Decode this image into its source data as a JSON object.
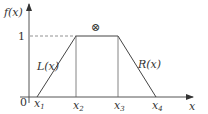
{
  "figure": {
    "type": "trapezoidal membership function",
    "y_axis_label": "f(x)",
    "x_axis_label": "x",
    "origin_label": "0",
    "y_tick_label": "1",
    "x_ticks": [
      {
        "base": "x",
        "sub": "1"
      },
      {
        "base": "x",
        "sub": "2"
      },
      {
        "base": "x",
        "sub": "3"
      },
      {
        "base": "x",
        "sub": "4"
      }
    ],
    "left_curve_label": "L(x)",
    "right_curve_label": "R(x)",
    "top_symbol": "⊗",
    "line_color": "#444444"
  }
}
